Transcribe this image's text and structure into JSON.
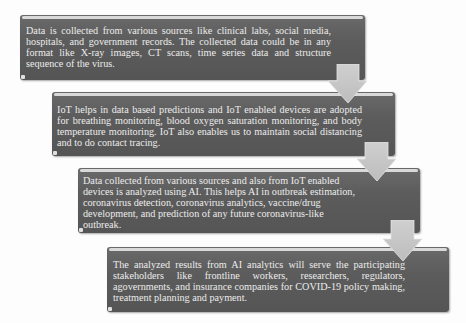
{
  "diagram": {
    "type": "vertical-process-flow",
    "colors": {
      "box_fill": "#5c5c5c",
      "box_text": "#ececec",
      "box_highlight": "#d9d9d9",
      "arrow_fill": "#c8c8c8",
      "background": "#ffffff"
    },
    "steps": [
      {
        "id": "step-1",
        "text": "Data is collected from various sources like clinical labs, social media, hospitals, and government records. The collected data could be in any format like X-ray images, CT scans, time series data and structure sequence of the virus."
      },
      {
        "id": "step-2",
        "text": "IoT helps in data based predictions and IoT enabled devices are adopted for breathing monitoring, blood oxygen saturation monitoring, and body temperature monitoring. IoT also enables us to maintain social distancing and to do contact tracing."
      },
      {
        "id": "step-3",
        "text": "Data collected from various sources and also from IoT enabled devices is analyzed using AI. This helps AI in outbreak estimation, coronavirus detection, coronavirus analytics, vaccine/drug development, and prediction of any future coronavirus-like outbreak."
      },
      {
        "id": "step-4",
        "text": "The analyzed results from AI analytics will serve the participating stakeholders like frontline workers, researchers, regulators, agovernments, and insurance companies for COVID-19 policy making, treatment planning and payment."
      }
    ],
    "arrows": [
      {
        "from": "step-1",
        "to": "step-2",
        "direction": "down"
      },
      {
        "from": "step-2",
        "to": "step-3",
        "direction": "down"
      },
      {
        "from": "step-3",
        "to": "step-4",
        "direction": "down"
      }
    ]
  }
}
